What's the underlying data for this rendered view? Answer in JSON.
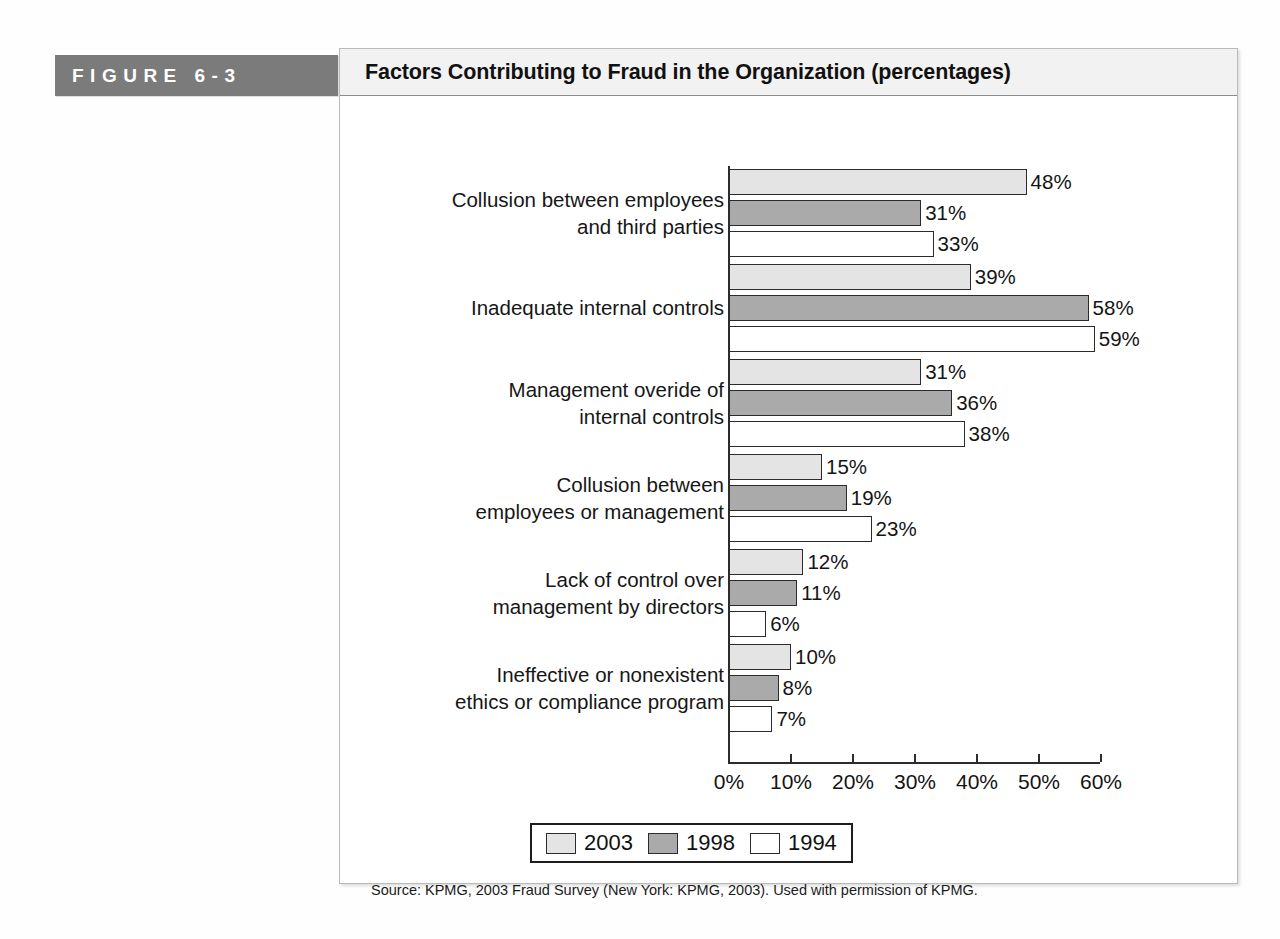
{
  "figure": {
    "tag_label": "F I G U R E   6 – 3",
    "tag_text": "FIGURE 6-3",
    "title": "Factors Contributing to Fraud in the Organization (percentages)",
    "source": "Source: KPMG, 2003 Fraud Survey (New York: KPMG, 2003). Used with permission of KPMG.",
    "accent_color": "#7b7b7b",
    "titlebar_color": "#f2f2f2"
  },
  "chart_data": {
    "type": "bar",
    "orientation": "horizontal",
    "title": "Factors Contributing to Fraud in the Organization (percentages)",
    "xlabel": "",
    "ylabel": "",
    "xlim": [
      0,
      60
    ],
    "grid": false,
    "legend_position": "bottom",
    "tick_labels": [
      "0%",
      "10%",
      "20%",
      "30%",
      "40%",
      "50%",
      "60%"
    ],
    "tick_values": [
      0,
      10,
      20,
      30,
      40,
      50,
      60
    ],
    "categories": [
      "Collusion between employees\nand third parties",
      "Inadequate internal controls",
      "Management overide of\ninternal controls",
      "Collusion between\nemployees or management",
      "Lack of control over\nmanagement by directors",
      "Ineffective or nonexistent\nethics or compliance program"
    ],
    "series": [
      {
        "name": "2003",
        "color": "#e4e4e4",
        "values": [
          48,
          39,
          31,
          15,
          12,
          10
        ],
        "labels": [
          "48%",
          "39%",
          "31%",
          "15%",
          "12%",
          "10%"
        ]
      },
      {
        "name": "1998",
        "color": "#aaaaaa",
        "values": [
          31,
          58,
          36,
          19,
          11,
          8
        ],
        "labels": [
          "31%",
          "58%",
          "36%",
          "19%",
          "11%",
          "8%"
        ]
      },
      {
        "name": "1994",
        "color": "#ffffff",
        "values": [
          33,
          59,
          38,
          23,
          6,
          7
        ],
        "labels": [
          "33%",
          "59%",
          "38%",
          "23%",
          "6%",
          "7%"
        ]
      }
    ]
  }
}
